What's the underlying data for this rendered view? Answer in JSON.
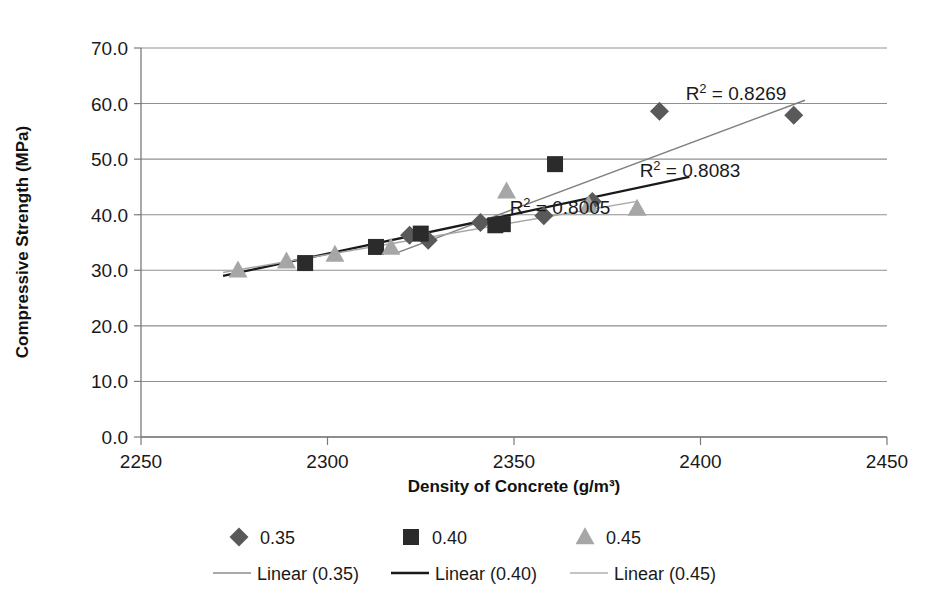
{
  "chart_data": {
    "type": "scatter",
    "title": "",
    "xlabel": "Density of Concrete (g/m³)",
    "ylabel": "Compressive Strength (MPa)",
    "xlim": [
      2250,
      2450
    ],
    "ylim": [
      0,
      70
    ],
    "xticks": [
      "2250",
      "2300",
      "2350",
      "2400",
      "2450"
    ],
    "yticks": [
      "0.0",
      "10.0",
      "20.0",
      "30.0",
      "40.0",
      "50.0",
      "60.0",
      "70.0"
    ],
    "grid": "horizontal",
    "legend_position": "bottom",
    "series": [
      {
        "name": "0.35",
        "marker": "diamond",
        "color": "#595959",
        "points": [
          {
            "x": 2322,
            "y": 36.3
          },
          {
            "x": 2327,
            "y": 35.4
          },
          {
            "x": 2341,
            "y": 38.6
          },
          {
            "x": 2358,
            "y": 39.8
          },
          {
            "x": 2371,
            "y": 42.4
          },
          {
            "x": 2389,
            "y": 58.6
          },
          {
            "x": 2425,
            "y": 57.9
          }
        ]
      },
      {
        "name": "0.40",
        "marker": "square",
        "color": "#2b2b2b",
        "points": [
          {
            "x": 2294,
            "y": 31.3
          },
          {
            "x": 2313,
            "y": 34.2
          },
          {
            "x": 2325,
            "y": 36.6
          },
          {
            "x": 2345,
            "y": 38.1
          },
          {
            "x": 2347,
            "y": 38.3
          },
          {
            "x": 2361,
            "y": 49.1
          }
        ]
      },
      {
        "name": "0.45",
        "marker": "triangle",
        "color": "#a6a6a6",
        "points": [
          {
            "x": 2276,
            "y": 30.0
          },
          {
            "x": 2289,
            "y": 31.6
          },
          {
            "x": 2302,
            "y": 32.8
          },
          {
            "x": 2317,
            "y": 34.1
          },
          {
            "x": 2348,
            "y": 44.2
          },
          {
            "x": 2370,
            "y": 41.7
          },
          {
            "x": 2383,
            "y": 41.1
          }
        ]
      }
    ],
    "trendlines": [
      {
        "name": "Linear (0.35)",
        "color": "#7f7f7f",
        "x1": 2318,
        "y1": 33.0,
        "x2": 2428,
        "y2": 60.6,
        "r2_label": "R² = 0.8269",
        "r2_value": 0.8269
      },
      {
        "name": "Linear (0.40)",
        "color": "#1a1a1a",
        "x1": 2272,
        "y1": 29.0,
        "x2": 2397,
        "y2": 46.8,
        "r2_label": "R² = 0.8083",
        "r2_value": 0.8083
      },
      {
        "name": "Linear (0.45)",
        "color": "#a6a6a6",
        "x1": 2272,
        "y1": 29.6,
        "x2": 2383,
        "y2": 42.4,
        "r2_label": "R² = 0.8005",
        "r2_value": 0.8005
      }
    ],
    "annotations": [
      {
        "text": "R² = 0.8269",
        "x_px": 736,
        "y_px": 100
      },
      {
        "text": "R² = 0.8083",
        "x_px": 690,
        "y_px": 177
      },
      {
        "text": "R² = 0.8005",
        "x_px": 560,
        "y_px": 214
      }
    ]
  },
  "legend": {
    "markers": [
      {
        "label": "0.35",
        "shape": "diamond",
        "color": "#595959"
      },
      {
        "label": "0.40",
        "shape": "square",
        "color": "#2b2b2b"
      },
      {
        "label": "0.45",
        "shape": "triangle",
        "color": "#a6a6a6"
      }
    ],
    "lines": [
      {
        "label": "Linear (0.35)",
        "color": "#8c8c8c"
      },
      {
        "label": "Linear (0.40)",
        "color": "#1a1a1a"
      },
      {
        "label": "Linear (0.45)",
        "color": "#b0b0b0"
      }
    ]
  }
}
